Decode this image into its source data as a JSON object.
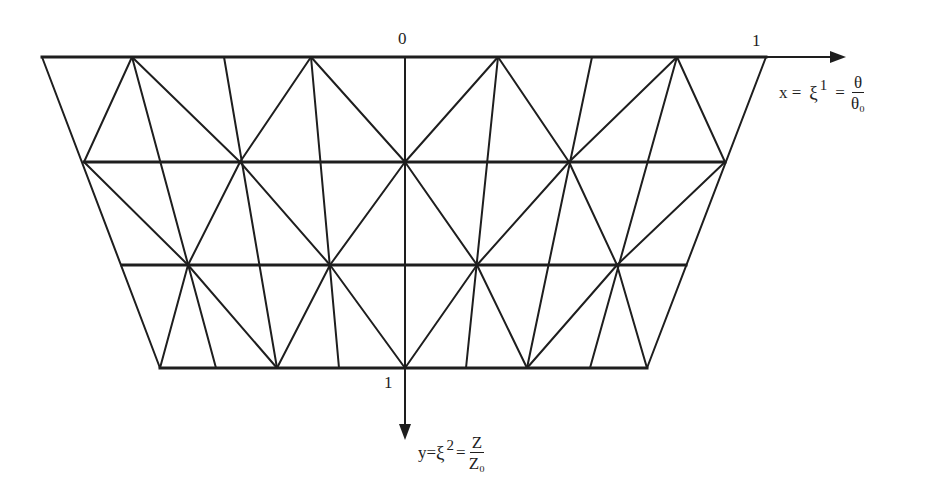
{
  "diagram": {
    "type": "triangular finite element mesh on trapezoidal domain",
    "colors": {
      "ink": "#1e1e1e",
      "background": "#ffffff"
    },
    "axes": {
      "x": {
        "origin_label": "0",
        "end_label": "1",
        "equation": {
          "lhs": "x =",
          "symbol": "ξ",
          "superscript": "1",
          "eq": "=",
          "num": "θ",
          "den": "θ₀"
        }
      },
      "y": {
        "end_label": "1",
        "equation": {
          "lhs": "y=",
          "symbol": "ξ",
          "superscript": "2",
          "eq": "=",
          "num": "Z",
          "den": "Z₀"
        }
      }
    },
    "rows": [
      {
        "y": 57,
        "x": [
          42,
          132,
          224,
          311,
          405,
          498,
          592,
          677,
          766
        ]
      },
      {
        "y": 162,
        "x": [
          84,
          160,
          240,
          322,
          405,
          489,
          569,
          648,
          725
        ]
      },
      {
        "y": 265,
        "x": [
          122,
          188,
          260,
          330,
          405,
          477,
          548,
          617,
          686
        ]
      },
      {
        "y": 368,
        "x": [
          160,
          216,
          277,
          339,
          405,
          466,
          527,
          590,
          647
        ]
      }
    ]
  }
}
